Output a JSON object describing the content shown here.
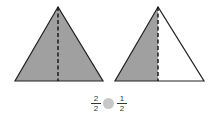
{
  "figure": {
    "left_triangle": {
      "shaded": "whole",
      "fill": "#a0a0a0"
    },
    "right_triangle": {
      "shaded": "left half",
      "fill": "#a0a0a0"
    },
    "comparison": {
      "left_fraction": {
        "numerator": "2",
        "denominator": "2"
      },
      "symbol_placeholder_color": "#c8c8c8",
      "right_fraction": {
        "numerator": "1",
        "denominator": "2"
      }
    }
  }
}
